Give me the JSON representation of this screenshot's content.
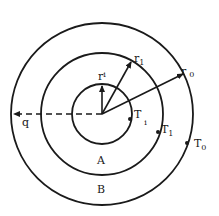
{
  "diagram": {
    "type": "concentric-cylinder-heat-conduction",
    "center": {
      "x": 102,
      "y": 114
    },
    "circles": [
      {
        "id": "inner",
        "radius": 30,
        "radius_label": "r",
        "radius_sub": "i",
        "temp_label": "T",
        "temp_sub": "i"
      },
      {
        "id": "middle",
        "radius": 61,
        "radius_label": "r",
        "radius_sub": "1",
        "temp_label": "T",
        "temp_sub": "1"
      },
      {
        "id": "outer",
        "radius": 91,
        "radius_label": "r",
        "radius_sub": "0",
        "temp_label": "T",
        "temp_sub": "0"
      }
    ],
    "regions": [
      {
        "id": "A",
        "label": "A"
      },
      {
        "id": "B",
        "label": "B"
      }
    ],
    "heat_flux": {
      "label": "q",
      "style": "dashed-arrow",
      "direction": "left"
    },
    "colors": {
      "stroke": "#1a1a1a",
      "background": "#ffffff"
    }
  }
}
